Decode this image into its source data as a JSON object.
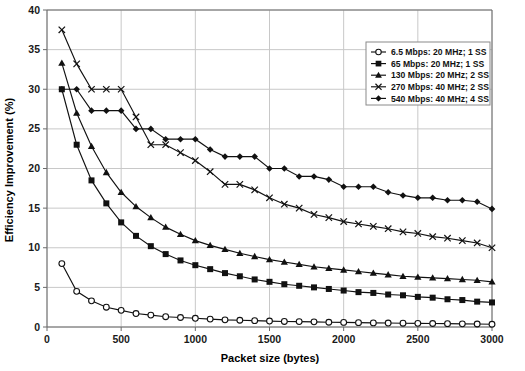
{
  "chart_data": {
    "type": "line",
    "title": "",
    "xlabel": "Packet size (bytes)",
    "ylabel": "Efficiency Improvement (%)",
    "xlim": [
      0,
      3000
    ],
    "ylim": [
      0,
      40
    ],
    "xticks": [
      0,
      500,
      1000,
      1500,
      2000,
      2500,
      3000
    ],
    "yticks": [
      0,
      5,
      10,
      15,
      20,
      25,
      30,
      35,
      40
    ],
    "grid": true,
    "legend_position": "top-right",
    "x": [
      100,
      200,
      300,
      400,
      500,
      600,
      700,
      800,
      900,
      1000,
      1100,
      1200,
      1300,
      1400,
      1500,
      1600,
      1700,
      1800,
      1900,
      2000,
      2100,
      2200,
      2300,
      2400,
      2500,
      2600,
      2700,
      2800,
      2900,
      3000
    ],
    "series": [
      {
        "name": "6.5 Mbps: 20 MHz; 1 SS",
        "marker": "open-circle",
        "values": [
          8.0,
          4.5,
          3.3,
          2.5,
          2.1,
          1.7,
          1.5,
          1.3,
          1.2,
          1.1,
          1.0,
          0.9,
          0.85,
          0.8,
          0.75,
          0.7,
          0.68,
          0.65,
          0.6,
          0.58,
          0.55,
          0.52,
          0.5,
          0.48,
          0.46,
          0.44,
          0.42,
          0.4,
          0.38,
          0.35
        ]
      },
      {
        "name": "65 Mbps: 20 MHz; 1 SS",
        "marker": "filled-square",
        "values": [
          30.0,
          23.0,
          18.5,
          15.6,
          13.2,
          11.5,
          10.2,
          9.2,
          8.4,
          7.8,
          7.3,
          6.8,
          6.4,
          6.0,
          5.7,
          5.4,
          5.2,
          5.0,
          4.8,
          4.6,
          4.4,
          4.3,
          4.1,
          4.0,
          3.8,
          3.7,
          3.5,
          3.4,
          3.2,
          3.1
        ]
      },
      {
        "name": "130 Mbps: 20 MHz; 2 SS",
        "marker": "filled-triangle",
        "values": [
          33.3,
          27.0,
          22.8,
          19.5,
          17.0,
          15.2,
          13.8,
          12.6,
          11.7,
          10.9,
          10.3,
          9.8,
          9.3,
          8.9,
          8.5,
          8.2,
          7.9,
          7.6,
          7.4,
          7.2,
          7.0,
          6.8,
          6.6,
          6.4,
          6.3,
          6.2,
          6.1,
          6.0,
          5.9,
          5.7
        ]
      },
      {
        "name": "270 Mbps: 40 MHz; 2 SS",
        "marker": "cross",
        "values": [
          37.5,
          33.2,
          30.0,
          30.0,
          30.0,
          26.5,
          23.0,
          23.0,
          22.0,
          21.0,
          19.6,
          18.0,
          18.0,
          17.3,
          16.3,
          15.5,
          15.0,
          14.2,
          13.8,
          13.3,
          13.0,
          12.7,
          12.4,
          12.0,
          11.8,
          11.4,
          11.2,
          10.9,
          10.6,
          10.0
        ]
      },
      {
        "name": "540 Mbps: 40 MHz; 4 SS",
        "marker": "filled-diamond",
        "values": [
          30.0,
          30.0,
          27.3,
          27.3,
          27.3,
          25.0,
          25.0,
          23.7,
          23.7,
          23.7,
          22.4,
          21.5,
          21.5,
          21.5,
          20.0,
          20.0,
          19.0,
          19.0,
          18.6,
          17.7,
          17.7,
          17.7,
          17.0,
          16.6,
          16.3,
          16.3,
          16.0,
          16.0,
          15.8,
          14.9
        ]
      }
    ]
  },
  "axes": {
    "y_title": "Efficiency Improvement (%)",
    "x_title": "Packet size (bytes)",
    "y_tick_labels": [
      "0",
      "5",
      "10",
      "15",
      "20",
      "25",
      "30",
      "35",
      "40"
    ],
    "x_tick_labels": [
      "0",
      "500",
      "1000",
      "1500",
      "2000",
      "2500",
      "3000"
    ]
  },
  "legend": {
    "items": [
      {
        "label": "6.5 Mbps: 20 MHz; 1 SS",
        "marker": "open-circle"
      },
      {
        "label": "65 Mbps: 20 MHz; 1 SS",
        "marker": "filled-square"
      },
      {
        "label": "130 Mbps: 20 MHz; 2 SS",
        "marker": "filled-triangle"
      },
      {
        "label": "270 Mbps: 40 MHz; 2 SS",
        "marker": "cross"
      },
      {
        "label": "540 Mbps: 40 MHz; 4 SS",
        "marker": "filled-diamond"
      }
    ]
  },
  "colors": {
    "series_stroke": "#111111",
    "grid": "#c8c8c8",
    "axis": "#6b6b6b",
    "background": "#ffffff"
  }
}
